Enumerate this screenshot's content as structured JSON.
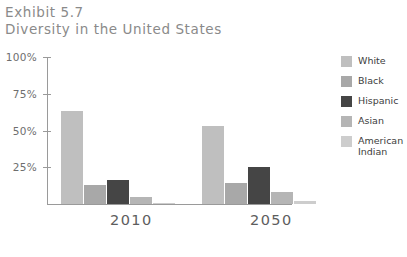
{
  "title": {
    "line1": "Exhibit 5.7",
    "line2": "Diversity in the United States"
  },
  "chart_data": {
    "type": "bar",
    "title": "Diversity in the United States",
    "subtitle": "Exhibit 5.7",
    "xlabel": "",
    "ylabel": "",
    "ylim": [
      0,
      100
    ],
    "yticks": [
      "25%",
      "50%",
      "75%",
      "100%"
    ],
    "ytick_values": [
      25,
      50,
      75,
      100
    ],
    "grid": false,
    "legend_position": "right",
    "categories": [
      "2010",
      "2050"
    ],
    "series": [
      {
        "name": "White",
        "color": "#bfbfbf",
        "values": [
          63,
          53
        ]
      },
      {
        "name": "Black",
        "color": "#a8a8a8",
        "values": [
          13,
          14
        ]
      },
      {
        "name": "Hispanic",
        "color": "#454545",
        "values": [
          16,
          25
        ]
      },
      {
        "name": "Asian",
        "color": "#b5b5b5",
        "values": [
          5,
          8
        ]
      },
      {
        "name": "American\nIndian",
        "color": "#cdcdcd",
        "values": [
          1,
          2
        ]
      }
    ]
  },
  "axis": {
    "tick_labels": [
      "100%",
      "75%",
      "50%",
      "25%"
    ]
  },
  "legend": {
    "items": [
      {
        "label": "White",
        "color": "#bfbfbf"
      },
      {
        "label": "Black",
        "color": "#a8a8a8"
      },
      {
        "label": "Hispanic",
        "color": "#454545"
      },
      {
        "label": "Asian",
        "color": "#b5b5b5"
      },
      {
        "label": "American\nIndian",
        "color": "#cdcdcd"
      }
    ]
  },
  "xaxis": {
    "labels": [
      "2010",
      "2050"
    ]
  },
  "caption": ""
}
